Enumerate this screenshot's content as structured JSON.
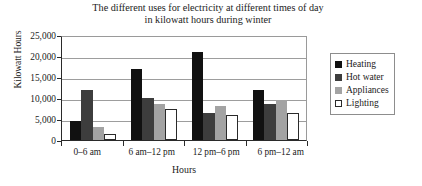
{
  "chart_data": {
    "type": "bar",
    "title": "The different uses for electricity at different times of day in kilowatt hours during winter",
    "title_lines": [
      "The different uses for electricity at different times of day",
      "in kilowatt hours during winter"
    ],
    "xlabel": "Hours",
    "ylabel": "Kilowatt Hours",
    "ylim": [
      0,
      25000
    ],
    "ytick_labels": [
      "25,000",
      "20,000",
      "15,000",
      "10,000",
      "5,000",
      "0"
    ],
    "ytick_values": [
      25000,
      20000,
      15000,
      10000,
      5000,
      0
    ],
    "grid": true,
    "legend_position": "right",
    "categories": [
      "0–6 am",
      "6 am–12 pm",
      "12 pm–6 pm",
      "6 pm–12 am"
    ],
    "series": [
      {
        "name": "Heating",
        "color": "#111111",
        "values": [
          4500,
          17000,
          21000,
          12000
        ]
      },
      {
        "name": "Hot water",
        "color": "#3d3d3d",
        "values": [
          12000,
          10000,
          6500,
          8500
        ]
      },
      {
        "name": "Appliances",
        "color": "#a3a3a3",
        "values": [
          3000,
          8500,
          8000,
          9500
        ]
      },
      {
        "name": "Lighting",
        "color": "#ffffff",
        "values": [
          1500,
          7500,
          6000,
          6500
        ]
      }
    ]
  }
}
